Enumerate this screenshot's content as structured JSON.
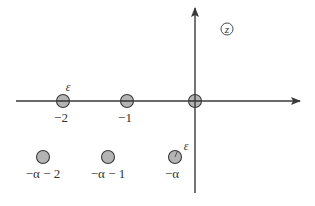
{
  "diagram": {
    "plane_label": "z",
    "colors": {
      "axis": "#3a3a3a",
      "circle_fill": "#b4b4b4",
      "circle_stroke": "#3a3a3a",
      "text": "#333333",
      "background": "#ffffff"
    },
    "axes": {
      "horizontal": {
        "from": [
          16,
          101
        ],
        "to": [
          300,
          101
        ]
      },
      "vertical": {
        "from": [
          195,
          193
        ],
        "to": [
          195,
          8
        ]
      }
    },
    "axis_points": [
      {
        "label": "-2",
        "display": "−2",
        "x": 63,
        "y": 101,
        "epsilon_label": "ε"
      },
      {
        "label": "-1",
        "display": "−1",
        "x": 127,
        "y": 101
      },
      {
        "label": "0",
        "display": "",
        "x": 195,
        "y": 101,
        "crosshair": true
      }
    ],
    "shifted_points": [
      {
        "label": "-alpha-2",
        "display": "−α − 2",
        "x": 43,
        "y": 157
      },
      {
        "label": "-alpha-1",
        "display": "−α − 1",
        "x": 108,
        "y": 157
      },
      {
        "label": "-alpha",
        "display": "−α",
        "x": 175,
        "y": 157,
        "epsilon_label": "ε"
      }
    ],
    "epsilon": "ε",
    "labels": {
      "minus_two": "−2",
      "minus_one": "−1",
      "minus_alpha_minus_two": "−α − 2",
      "minus_alpha_minus_one": "−α − 1",
      "minus_alpha": "−α",
      "epsilon_top": "ε",
      "epsilon_bottom": "ε"
    }
  }
}
